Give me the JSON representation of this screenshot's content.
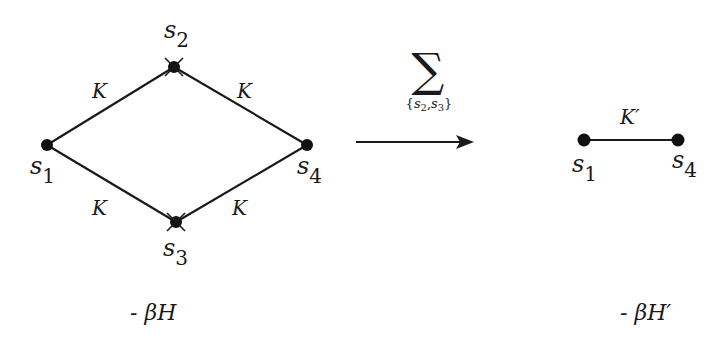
{
  "diagram": {
    "colors": {
      "ink": "#1a1a1a",
      "background": "#ffffff"
    },
    "left_graph": {
      "nodes": [
        {
          "id": "s1",
          "label": "s",
          "sub": "1",
          "x": 47,
          "y": 145,
          "summed": false
        },
        {
          "id": "s2",
          "label": "s",
          "sub": "2",
          "x": 174,
          "y": 67,
          "summed": true
        },
        {
          "id": "s3",
          "label": "s",
          "sub": "3",
          "x": 176,
          "y": 222,
          "summed": true
        },
        {
          "id": "s4",
          "label": "s",
          "sub": "4",
          "x": 307,
          "y": 145,
          "summed": false
        }
      ],
      "edges": [
        {
          "from": "s1",
          "to": "s2",
          "label": "K"
        },
        {
          "from": "s2",
          "to": "s4",
          "label": "K"
        },
        {
          "from": "s1",
          "to": "s3",
          "label": "K"
        },
        {
          "from": "s3",
          "to": "s4",
          "label": "K"
        }
      ],
      "caption": "- βH"
    },
    "transform": {
      "operator": "∑",
      "subscript_open": "{",
      "subscript_s2": "s",
      "subscript_s2_index": "2",
      "subscript_sep": ",",
      "subscript_s3": "s",
      "subscript_s3_index": "3",
      "subscript_close": "}",
      "arrow": "right-arrow"
    },
    "right_graph": {
      "nodes": [
        {
          "id": "s1",
          "label": "s",
          "sub": "1",
          "x": 584,
          "y": 140
        },
        {
          "id": "s4",
          "label": "s",
          "sub": "4",
          "x": 678,
          "y": 140
        }
      ],
      "edges": [
        {
          "from": "s1",
          "to": "s4",
          "label": "K′"
        }
      ],
      "caption": "- βH′"
    }
  }
}
